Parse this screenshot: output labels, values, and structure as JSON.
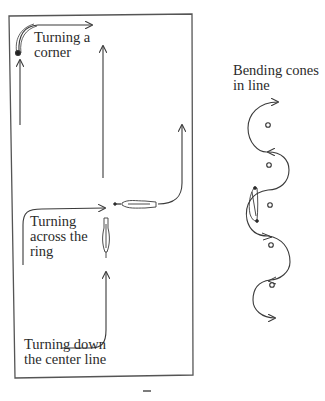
{
  "diagram": {
    "arena": {
      "labels": {
        "turning_corner": "Turning a\ncorner",
        "turning_across": "Turning\nacross the\nring",
        "turning_down": "Turning down\nthe center line"
      }
    },
    "cones": {
      "label": "Bending cones\nin line",
      "count": 6
    },
    "footer_mark": "‾"
  },
  "colors": {
    "line": "#3a3a3a",
    "background": "#ffffff"
  }
}
